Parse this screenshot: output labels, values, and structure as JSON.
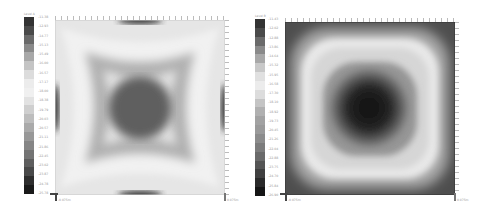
{
  "chart_data": [
    {
      "type": "heatmap",
      "title": "",
      "legend_title": "Level A",
      "colormap": "grayscale",
      "legend_ticks": [
        "-11.38",
        "-12.93",
        "-14.77",
        "-15.13",
        "-15.49",
        "-16.00",
        "-16.57",
        "-17.17",
        "-18.00",
        "-18.38",
        "-19.79",
        "-20.03",
        "-20.57",
        "-21.11",
        "-21.86",
        "-22.45",
        "-23.02",
        "-23.87",
        "-24.78",
        "-25.78"
      ],
      "legend_colors": [
        "#333333",
        "#4a4a4a",
        "#6a6a6a",
        "#8a8a8a",
        "#a8a8a8",
        "#c4c4c4",
        "#dcdcdc",
        "#ececec",
        "#f0f0f0",
        "#e2e2e2",
        "#cfcfcf",
        "#bdbdbd",
        "#aaaaaa",
        "#989898",
        "#868686",
        "#747474",
        "#5e5e5e",
        "#494949",
        "#2e2e2e",
        "#1a1a1a"
      ],
      "pattern": "four-pointed star / concave square: dark center, light band, dark edges at midpoints",
      "x_axis_labels": [
        "-0.075m",
        "0.075m"
      ],
      "grid": false
    },
    {
      "type": "heatmap",
      "title": "",
      "legend_title": "Level B",
      "colormap": "grayscale",
      "legend_ticks": [
        "-11.43",
        "-12.02",
        "-12.88",
        "-13.86",
        "-14.64",
        "-15.32",
        "-15.95",
        "-16.58",
        "-17.30",
        "-18.10",
        "-18.92",
        "-19.73",
        "-20.45",
        "-21.26",
        "-22.04",
        "-22.88",
        "-23.75",
        "-24.70",
        "-25.84",
        "-26.90"
      ],
      "legend_colors": [
        "#333333",
        "#4a4a4a",
        "#6a6a6a",
        "#8a8a8a",
        "#a8a8a8",
        "#c8c8c8",
        "#e0e0e0",
        "#ececec",
        "#dcdcdc",
        "#c4c4c4",
        "#b0b0b0",
        "#a2a2a2",
        "#9a9a9a",
        "#8c8c8c",
        "#7c7c7c",
        "#6a6a6a",
        "#555555",
        "#404040",
        "#2a2a2a",
        "#151515"
      ],
      "pattern": "concentric rounded square: dark center disc, gray ring, light band, darker border",
      "x_axis_labels": [
        "-0.075m",
        "0.075m"
      ],
      "grid": false
    }
  ]
}
